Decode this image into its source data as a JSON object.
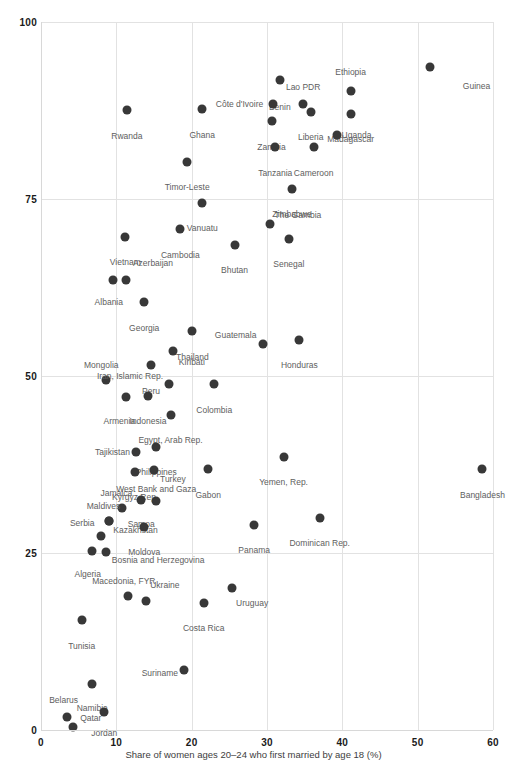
{
  "chart_data": {
    "type": "scatter",
    "title": "",
    "xlabel": "Share of women ages 20–24 who first married by age 18 (%)",
    "ylabel": "",
    "xlim": [
      0,
      60
    ],
    "ylim": [
      0,
      100
    ],
    "xticks": [
      "0",
      "10",
      "20",
      "30",
      "40",
      "50",
      "60"
    ],
    "yticks": [
      "0",
      "25",
      "50",
      "75",
      "100"
    ],
    "grid": true,
    "legend": "none",
    "marker_color": "#383838",
    "grid_color": "#e2e2e2",
    "label_color": "#5e5e5e",
    "points": [
      {
        "name": "Guinea",
        "x": 51.7,
        "y": 93.7,
        "lx": 56.0,
        "ly": 91.0,
        "anchor": "right"
      },
      {
        "name": "Ethiopia",
        "x": 41.1,
        "y": 90.3,
        "lx": 41.1,
        "ly": 93.5,
        "anchor": "below"
      },
      {
        "name": "Benin",
        "x": 31.7,
        "y": 91.8,
        "lx": 31.7,
        "ly": 88.6,
        "anchor": "below"
      },
      {
        "name": "Madagascar",
        "x": 41.1,
        "y": 87.0,
        "lx": 41.1,
        "ly": 84.0,
        "anchor": "below"
      },
      {
        "name": "Lao PDR",
        "x": 34.8,
        "y": 88.4,
        "lx": 34.8,
        "ly": 91.4,
        "anchor": "below"
      },
      {
        "name": "Côte d'Ivoire",
        "x": 30.8,
        "y": 88.4,
        "lx": 29.5,
        "ly": 88.4,
        "anchor": "left"
      },
      {
        "name": "Liberia",
        "x": 35.8,
        "y": 87.3,
        "lx": 35.8,
        "ly": 84.3,
        "anchor": "below"
      },
      {
        "name": "Zambia",
        "x": 30.6,
        "y": 86.0,
        "lx": 30.6,
        "ly": 82.9,
        "anchor": "below"
      },
      {
        "name": "Uganda",
        "x": 39.3,
        "y": 84.0,
        "lx": 39.9,
        "ly": 84.0,
        "anchor": "right"
      },
      {
        "name": "Cameroon",
        "x": 36.2,
        "y": 82.3,
        "lx": 36.2,
        "ly": 79.3,
        "anchor": "below"
      },
      {
        "name": "Rwanda",
        "x": 11.4,
        "y": 87.6,
        "lx": 11.4,
        "ly": 84.5,
        "anchor": "below"
      },
      {
        "name": "Ghana",
        "x": 21.4,
        "y": 87.7,
        "lx": 21.4,
        "ly": 84.6,
        "anchor": "below"
      },
      {
        "name": "Tanzania",
        "x": 31.1,
        "y": 82.4,
        "lx": 31.1,
        "ly": 79.3,
        "anchor": "below"
      },
      {
        "name": "Timor-Leste",
        "x": 19.4,
        "y": 80.2,
        "lx": 19.4,
        "ly": 77.2,
        "anchor": "below"
      },
      {
        "name": "Zimbabwe",
        "x": 33.3,
        "y": 76.4,
        "lx": 33.3,
        "ly": 73.4,
        "anchor": "below"
      },
      {
        "name": "Vanuatu",
        "x": 21.4,
        "y": 74.5,
        "lx": 21.4,
        "ly": 71.5,
        "anchor": "below"
      },
      {
        "name": "The Gambia",
        "x": 30.4,
        "y": 71.4,
        "lx": 31.0,
        "ly": 72.8,
        "anchor": "right"
      },
      {
        "name": "Senegal",
        "x": 32.9,
        "y": 69.4,
        "lx": 32.9,
        "ly": 66.4,
        "anchor": "below"
      },
      {
        "name": "Cambodia",
        "x": 18.5,
        "y": 70.7,
        "lx": 18.5,
        "ly": 67.7,
        "anchor": "below"
      },
      {
        "name": "Vietnam",
        "x": 11.2,
        "y": 69.7,
        "lx": 11.2,
        "ly": 66.7,
        "anchor": "below"
      },
      {
        "name": "Bhutan",
        "x": 25.7,
        "y": 68.5,
        "lx": 25.7,
        "ly": 65.5,
        "anchor": "below"
      },
      {
        "name": "Azerbaijan",
        "x": 11.3,
        "y": 63.5,
        "lx": 12.2,
        "ly": 66.0,
        "anchor": "right"
      },
      {
        "name": "Albania",
        "x": 9.6,
        "y": 63.5,
        "lx": 9.0,
        "ly": 61.0,
        "anchor": "below"
      },
      {
        "name": "Georgia",
        "x": 13.7,
        "y": 60.4,
        "lx": 13.7,
        "ly": 57.4,
        "anchor": "below"
      },
      {
        "name": "Thailand",
        "x": 20.1,
        "y": 56.3,
        "lx": 20.1,
        "ly": 53.3,
        "anchor": "below"
      },
      {
        "name": "Guatemala",
        "x": 29.5,
        "y": 54.5,
        "lx": 28.6,
        "ly": 55.8,
        "anchor": "left"
      },
      {
        "name": "Honduras",
        "x": 34.3,
        "y": 55.1,
        "lx": 34.3,
        "ly": 52.1,
        "anchor": "below"
      },
      {
        "name": "Kiribati",
        "x": 17.5,
        "y": 53.5,
        "lx": 18.3,
        "ly": 52.0,
        "anchor": "right"
      },
      {
        "name": "Peru",
        "x": 14.6,
        "y": 51.5,
        "lx": 14.6,
        "ly": 48.5,
        "anchor": "below"
      },
      {
        "name": "Mongolia",
        "x": 8.6,
        "y": 49.5,
        "lx": 8.0,
        "ly": 52.1,
        "anchor": "below"
      },
      {
        "name": "Iran, Islamic Rep.",
        "x": 17.0,
        "y": 48.8,
        "lx": 16.2,
        "ly": 50.0,
        "anchor": "left"
      },
      {
        "name": "Colombia",
        "x": 23.0,
        "y": 48.8,
        "lx": 23.0,
        "ly": 45.8,
        "anchor": "below"
      },
      {
        "name": "Armenia",
        "x": 11.3,
        "y": 47.0,
        "lx": 10.4,
        "ly": 44.2,
        "anchor": "below"
      },
      {
        "name": "Indonesia",
        "x": 14.2,
        "y": 47.2,
        "lx": 14.2,
        "ly": 44.2,
        "anchor": "below"
      },
      {
        "name": "Egypt, Arab Rep.",
        "x": 17.2,
        "y": 44.5,
        "lx": 17.2,
        "ly": 41.5,
        "anchor": "below"
      },
      {
        "name": "Philippines",
        "x": 15.3,
        "y": 40.0,
        "lx": 15.3,
        "ly": 37.0,
        "anchor": "below"
      },
      {
        "name": "Tajikistan",
        "x": 12.6,
        "y": 39.3,
        "lx": 11.8,
        "ly": 39.3,
        "anchor": "left"
      },
      {
        "name": "Turkey",
        "x": 15.0,
        "y": 36.7,
        "lx": 15.8,
        "ly": 35.5,
        "anchor": "right"
      },
      {
        "name": "Kyrgyz Rep.",
        "x": 12.5,
        "y": 36.5,
        "lx": 12.5,
        "ly": 33.5,
        "anchor": "below"
      },
      {
        "name": "West Bank and Gaza",
        "x": 15.3,
        "y": 32.3,
        "lx": 15.3,
        "ly": 34.6,
        "anchor": "below"
      },
      {
        "name": "Gabon",
        "x": 22.2,
        "y": 36.8,
        "lx": 22.2,
        "ly": 33.8,
        "anchor": "below"
      },
      {
        "name": "Yemen, Rep.",
        "x": 32.2,
        "y": 38.6,
        "lx": 32.2,
        "ly": 35.6,
        "anchor": "below"
      },
      {
        "name": "Bangladesh",
        "x": 58.6,
        "y": 36.8,
        "lx": 58.6,
        "ly": 33.8,
        "anchor": "below"
      },
      {
        "name": "Jamaica",
        "x": 10.8,
        "y": 31.3,
        "lx": 10.0,
        "ly": 34.0,
        "anchor": "below"
      },
      {
        "name": "Samoa",
        "x": 13.3,
        "y": 32.5,
        "lx": 13.3,
        "ly": 29.7,
        "anchor": "below"
      },
      {
        "name": "Maldives",
        "x": 9.0,
        "y": 29.5,
        "lx": 8.3,
        "ly": 32.2,
        "anchor": "below"
      },
      {
        "name": "Kazakhstan",
        "x": 9.0,
        "y": 29.5,
        "lx": 9.6,
        "ly": 28.2,
        "anchor": "right"
      },
      {
        "name": "Moldova",
        "x": 13.7,
        "y": 28.7,
        "lx": 13.7,
        "ly": 25.7,
        "anchor": "below"
      },
      {
        "name": "Serbia",
        "x": 7.9,
        "y": 27.4,
        "lx": 7.1,
        "ly": 29.2,
        "anchor": "left"
      },
      {
        "name": "Panama",
        "x": 28.3,
        "y": 29.0,
        "lx": 28.3,
        "ly": 26.0,
        "anchor": "below"
      },
      {
        "name": "Dominican Rep.",
        "x": 37.0,
        "y": 30.0,
        "lx": 37.0,
        "ly": 27.0,
        "anchor": "below"
      },
      {
        "name": "Algeria",
        "x": 6.8,
        "y": 25.3,
        "lx": 6.2,
        "ly": 22.6,
        "anchor": "below"
      },
      {
        "name": "Bosnia and Herzegovina",
        "x": 8.6,
        "y": 25.1,
        "lx": 9.4,
        "ly": 24.0,
        "anchor": "right"
      },
      {
        "name": "Macedonia, FYR",
        "x": 11.6,
        "y": 18.9,
        "lx": 11.0,
        "ly": 21.6,
        "anchor": "below"
      },
      {
        "name": "Ukraine",
        "x": 13.9,
        "y": 18.2,
        "lx": 14.5,
        "ly": 20.5,
        "anchor": "right"
      },
      {
        "name": "Uruguay",
        "x": 25.3,
        "y": 20.0,
        "lx": 25.9,
        "ly": 18.0,
        "anchor": "right"
      },
      {
        "name": "Costa Rica",
        "x": 21.6,
        "y": 18.0,
        "lx": 21.6,
        "ly": 15.0,
        "anchor": "below"
      },
      {
        "name": "Tunisia",
        "x": 5.4,
        "y": 15.5,
        "lx": 5.4,
        "ly": 12.5,
        "anchor": "below"
      },
      {
        "name": "Suriname",
        "x": 19.0,
        "y": 8.5,
        "lx": 18.2,
        "ly": 8.0,
        "anchor": "left"
      },
      {
        "name": "Namibia",
        "x": 6.8,
        "y": 6.5,
        "lx": 6.8,
        "ly": 3.7,
        "anchor": "below"
      },
      {
        "name": "Jordan",
        "x": 8.4,
        "y": 2.5,
        "lx": 8.4,
        "ly": 0.2,
        "anchor": "below"
      },
      {
        "name": "Belarus",
        "x": 3.4,
        "y": 1.8,
        "lx": 3.0,
        "ly": 4.8,
        "anchor": "below"
      },
      {
        "name": "Qatar",
        "x": 4.3,
        "y": 0.4,
        "lx": 5.2,
        "ly": 1.7,
        "anchor": "right"
      }
    ]
  },
  "axis": {
    "xtitle": "Share of women ages 20–24 who first married by age 18 (%)"
  }
}
